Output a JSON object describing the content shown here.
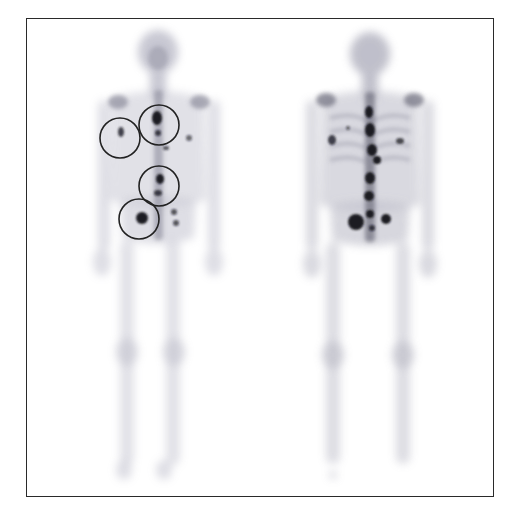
{
  "figure": {
    "type": "whole-body bone scintigraphy",
    "views": [
      {
        "id": "anterior",
        "label": "",
        "center_x": 158
      },
      {
        "id": "posterior",
        "label": "",
        "center_x": 370
      }
    ],
    "annotations": {
      "circles": [
        {
          "cx": 120,
          "cy": 138,
          "r": 20
        },
        {
          "cx": 159,
          "cy": 125,
          "r": 20
        },
        {
          "cx": 159,
          "cy": 186,
          "r": 20
        },
        {
          "cx": 139,
          "cy": 219,
          "r": 20
        }
      ],
      "circle_color": "#222222"
    },
    "colors": {
      "bone": "#8a8a9a",
      "hotspot": "#1c1c24",
      "frame": "#2a2a2a",
      "background": "#ffffff"
    }
  }
}
